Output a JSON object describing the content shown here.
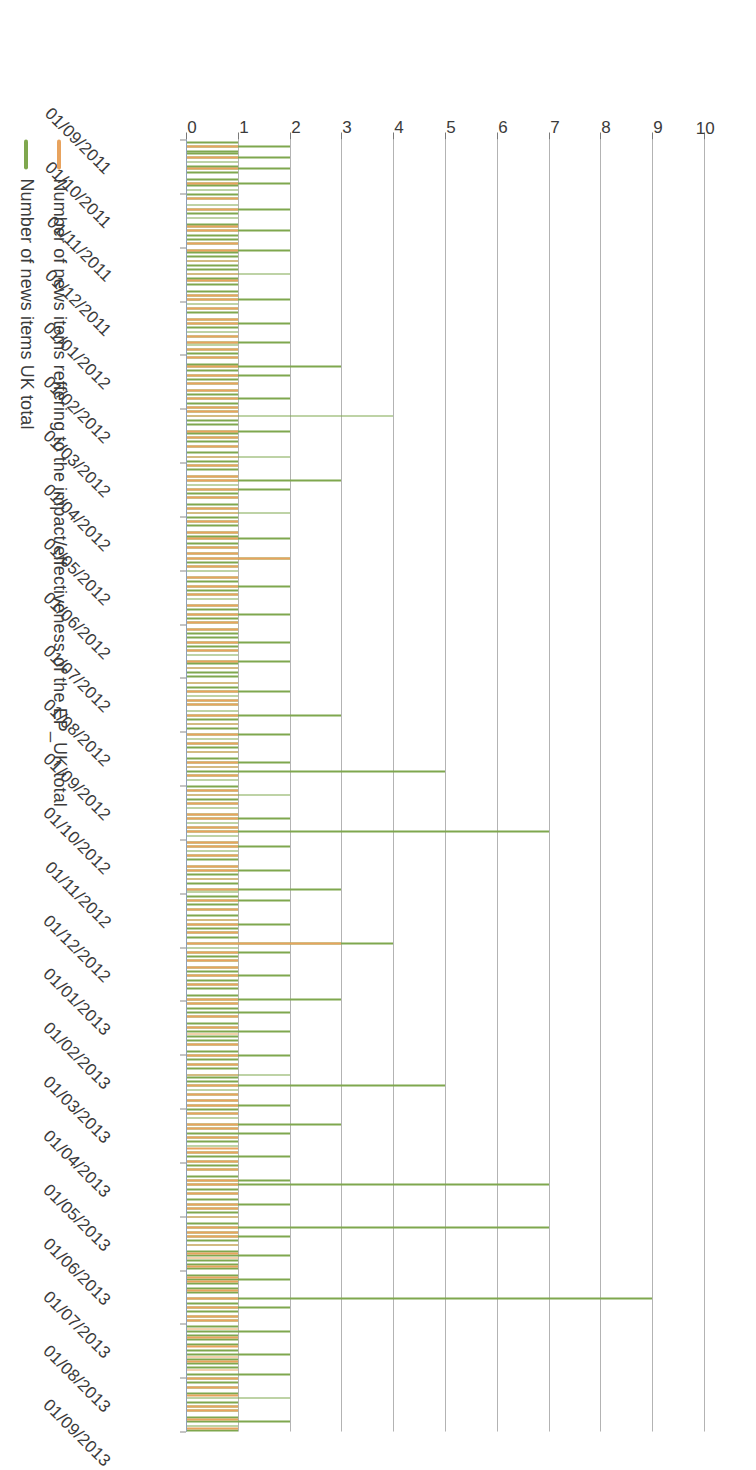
{
  "chart_data": {
    "type": "line",
    "title": "",
    "subtitle": "",
    "xlabel": "",
    "ylabel": "",
    "ylim": [
      0,
      10
    ],
    "yticks": [
      0,
      1,
      2,
      3,
      4,
      5,
      6,
      7,
      8,
      9,
      10
    ],
    "grid": true,
    "legend_position": "bottom-left",
    "orientation": "rotated-90-clockwise",
    "x_tick_labels": [
      "01/09/2011",
      "01/10/2011",
      "01/11/2011",
      "01/12/2011",
      "01/01/2012",
      "01/02/2012",
      "01/03/2012",
      "01/04/2012",
      "01/05/2012",
      "01/06/2012",
      "01/07/2012",
      "01/08/2012",
      "01/09/2012",
      "01/10/2012",
      "01/11/2012",
      "01/12/2012",
      "01/01/2013",
      "01/02/2013",
      "01/03/2013",
      "01/04/2013",
      "01/05/2013",
      "01/06/2013",
      "01/07/2013",
      "01/08/2013",
      "01/09/2013"
    ],
    "colors": {
      "series_uk_total": "#7fa74e",
      "series_ep_impact": "#e8a35e",
      "gridline": "#9a9a9a",
      "axis": "#8d9fb8",
      "text": "#3b3b3b",
      "background": "#ffffff"
    },
    "series": [
      {
        "name": "Number of news items UK total",
        "color": "#7fa74e",
        "values": [
          0,
          1,
          0,
          2,
          0,
          1,
          1,
          0,
          2,
          0,
          1,
          0,
          1,
          2,
          0,
          1,
          0,
          0,
          1,
          0,
          2,
          1,
          0,
          1,
          0,
          1,
          0,
          1,
          0,
          0,
          1,
          0,
          2,
          0,
          1,
          0,
          1,
          0,
          0,
          1,
          1,
          0,
          2,
          0,
          1,
          0,
          1,
          0,
          1,
          0,
          0,
          2,
          1,
          0,
          1,
          0,
          1,
          0,
          1,
          0,
          1,
          0,
          2,
          0,
          1,
          1,
          0,
          1,
          0,
          0,
          1,
          0,
          1,
          0,
          2,
          0,
          1,
          0,
          1,
          0,
          1,
          0,
          0,
          1,
          0,
          2,
          0,
          1,
          0,
          1,
          0,
          1,
          0,
          0,
          2,
          1,
          0,
          1,
          0,
          1,
          0,
          1,
          0,
          0,
          1,
          3,
          0,
          1,
          0,
          2,
          0,
          1,
          0,
          1,
          0,
          0,
          1,
          0,
          1,
          0,
          2,
          0,
          1,
          0,
          1,
          0,
          1,
          0,
          4,
          0,
          1,
          0,
          1,
          0,
          0,
          2,
          1,
          0,
          1,
          0,
          1,
          0,
          1,
          0,
          0,
          1,
          0,
          2,
          0,
          1,
          0,
          1,
          0,
          1,
          0,
          0,
          1,
          0,
          3,
          0,
          1,
          0,
          2,
          0,
          1,
          0,
          1,
          0,
          0,
          1,
          0,
          1,
          0,
          2,
          0,
          1,
          0,
          1,
          0,
          1,
          0,
          0,
          1,
          0,
          1,
          2,
          0,
          1,
          0,
          1,
          0,
          0,
          1,
          0,
          2,
          0,
          1,
          0,
          1,
          0,
          1,
          0,
          0,
          1,
          0,
          1,
          0,
          2,
          0,
          1,
          0,
          1,
          0,
          1,
          0,
          0,
          1,
          0,
          1,
          0,
          2,
          0,
          1,
          0,
          1,
          0,
          0,
          1,
          0,
          1,
          0,
          1,
          0,
          2,
          0,
          1,
          0,
          1,
          0,
          1,
          0,
          0,
          2,
          1,
          0,
          1,
          0,
          1,
          0,
          1,
          0,
          0,
          1,
          0,
          1,
          0,
          2,
          0,
          1,
          0,
          1,
          0,
          1,
          0,
          0,
          1,
          0,
          3,
          0,
          1,
          0,
          1,
          0,
          1,
          0,
          0,
          2,
          0,
          1,
          0,
          1,
          0,
          1,
          0,
          1,
          0,
          0,
          1,
          0,
          2,
          0,
          1,
          0,
          5,
          0,
          1,
          0,
          1,
          0,
          0,
          1,
          0,
          1,
          0,
          2,
          0,
          1,
          0,
          1,
          0,
          1,
          0,
          0,
          1,
          0,
          2,
          0,
          1,
          0,
          1,
          0,
          7,
          0,
          1,
          0,
          0,
          1,
          0,
          2,
          0,
          1,
          0,
          1,
          0,
          1,
          0,
          0,
          1,
          0,
          2,
          0,
          1,
          0,
          1,
          0,
          1,
          0,
          0,
          3,
          1,
          0,
          1,
          0,
          2,
          0,
          1,
          0,
          1,
          0,
          0,
          1,
          0,
          1,
          0,
          2,
          0,
          1,
          0,
          1,
          0,
          1,
          0,
          0,
          4,
          0,
          1,
          0,
          2,
          0,
          1,
          0,
          1,
          0,
          0,
          1,
          0,
          1,
          0,
          2,
          0,
          1,
          0,
          1,
          0,
          1,
          0,
          0,
          1,
          0,
          3,
          0,
          1,
          0,
          1,
          0,
          2,
          0,
          1,
          0,
          0,
          1,
          0,
          1,
          0,
          2,
          0,
          1,
          0,
          1,
          0,
          1,
          0,
          0,
          1,
          0,
          2,
          0,
          1,
          0,
          1,
          0,
          1,
          0,
          0,
          2,
          1,
          0,
          1,
          0,
          5,
          0,
          1,
          0,
          1,
          0,
          0,
          1,
          0,
          2,
          0,
          1,
          0,
          1,
          0,
          1,
          0,
          0,
          3,
          0,
          1,
          0,
          2,
          0,
          1,
          0,
          1,
          0,
          1,
          0,
          0,
          1,
          0,
          2,
          0,
          1,
          0,
          1,
          0,
          1,
          0,
          0,
          1,
          0,
          2,
          0,
          7,
          0,
          1,
          0,
          1,
          0,
          0,
          1,
          0,
          2,
          0,
          1,
          0,
          1,
          0,
          1,
          0,
          0,
          1,
          0,
          7,
          0,
          1,
          0,
          2,
          0,
          1,
          0,
          1,
          0,
          0,
          1,
          0,
          2,
          0,
          1,
          0,
          1,
          0,
          1,
          0,
          0,
          1,
          0,
          2,
          0,
          1,
          0,
          1,
          0,
          1,
          0,
          0,
          9,
          0,
          1,
          0,
          2,
          0,
          1,
          0,
          1,
          0,
          1,
          0,
          0,
          1,
          0,
          2,
          0,
          1,
          0,
          1,
          0,
          1,
          0,
          0,
          1,
          0,
          2,
          0,
          1,
          0,
          1,
          0,
          1,
          0,
          0,
          2,
          0,
          1,
          0,
          1,
          0,
          1,
          0,
          0,
          1,
          0,
          2,
          0,
          1,
          0,
          1,
          0,
          1,
          0,
          0,
          1,
          0,
          2,
          0,
          1,
          0,
          1
        ]
      },
      {
        "name": "Number of news items reffering to the impact/effectiveness of the EP_UK total",
        "color": "#e8a35e",
        "values": [
          0,
          0,
          0,
          1,
          0,
          0,
          0,
          0,
          1,
          0,
          0,
          0,
          0,
          1,
          0,
          0,
          0,
          0,
          0,
          0,
          1,
          0,
          0,
          0,
          0,
          0,
          0,
          1,
          0,
          0,
          0,
          0,
          1,
          0,
          0,
          0,
          0,
          0,
          0,
          0,
          1,
          0,
          1,
          0,
          0,
          0,
          0,
          0,
          1,
          0,
          0,
          1,
          0,
          0,
          0,
          0,
          1,
          0,
          0,
          0,
          0,
          0,
          1,
          0,
          0,
          1,
          0,
          0,
          0,
          0,
          0,
          0,
          1,
          0,
          1,
          0,
          0,
          0,
          1,
          0,
          0,
          0,
          0,
          1,
          0,
          1,
          0,
          0,
          0,
          0,
          0,
          1,
          0,
          0,
          1,
          0,
          0,
          1,
          0,
          0,
          0,
          1,
          0,
          0,
          0,
          1,
          0,
          0,
          0,
          1,
          0,
          0,
          0,
          1,
          0,
          0,
          1,
          0,
          0,
          0,
          1,
          0,
          0,
          0,
          1,
          0,
          1,
          0,
          1,
          0,
          0,
          0,
          0,
          0,
          0,
          1,
          0,
          0,
          1,
          0,
          0,
          0,
          1,
          0,
          0,
          0,
          0,
          1,
          0,
          0,
          0,
          1,
          0,
          0,
          0,
          0,
          1,
          0,
          1,
          0,
          0,
          0,
          1,
          0,
          0,
          0,
          1,
          0,
          0,
          0,
          0,
          1,
          0,
          1,
          0,
          0,
          0,
          1,
          0,
          0,
          0,
          0,
          1,
          0,
          0,
          1,
          0,
          0,
          0,
          1,
          0,
          0,
          1,
          0,
          2,
          0,
          0,
          0,
          1,
          0,
          0,
          0,
          0,
          1,
          0,
          0,
          0,
          1,
          0,
          0,
          0,
          1,
          0,
          0,
          0,
          0,
          1,
          0,
          0,
          0,
          1,
          0,
          0,
          0,
          1,
          0,
          0,
          1,
          0,
          0,
          0,
          0,
          0,
          1,
          0,
          0,
          0,
          1,
          0,
          0,
          0,
          0,
          1,
          0,
          0,
          1,
          0,
          0,
          0,
          0,
          0,
          0,
          1,
          0,
          0,
          0,
          1,
          0,
          0,
          0,
          1,
          0,
          1,
          0,
          0,
          0,
          0,
          1,
          0,
          0,
          0,
          1,
          0,
          0,
          0,
          0,
          1,
          0,
          0,
          0,
          1,
          0,
          0,
          0,
          1,
          0,
          0,
          0,
          0,
          1,
          0,
          1,
          0,
          0,
          0,
          1,
          0,
          0,
          0,
          0,
          0,
          0,
          1,
          0,
          1,
          0,
          0,
          0,
          1,
          0,
          0,
          0,
          0,
          1,
          0,
          1,
          0,
          0,
          0,
          1,
          0,
          1,
          0,
          0,
          0,
          0,
          1,
          0,
          1,
          0,
          0,
          0,
          1,
          0,
          0,
          0,
          0,
          1,
          0,
          1,
          0,
          0,
          0,
          1,
          0,
          0,
          0,
          0,
          1,
          0,
          0,
          0,
          0,
          1,
          0,
          0,
          0,
          1,
          0,
          0,
          0,
          0,
          1,
          0,
          1,
          0,
          0,
          0,
          1,
          0,
          0,
          0,
          0,
          3,
          0,
          0,
          0,
          1,
          0,
          0,
          0,
          1,
          0,
          0,
          1,
          0,
          0,
          0,
          1,
          0,
          0,
          0,
          1,
          0,
          0,
          0,
          0,
          0,
          0,
          1,
          0,
          1,
          0,
          0,
          0,
          0,
          0,
          1,
          0,
          0,
          0,
          0,
          1,
          0,
          0,
          1,
          0,
          0,
          0,
          0,
          1,
          0,
          0,
          0,
          0,
          1,
          0,
          0,
          0,
          1,
          0,
          0,
          0,
          0,
          1,
          0,
          0,
          0,
          0,
          1,
          0,
          0,
          0,
          1,
          0,
          0,
          1,
          0,
          1,
          0,
          0,
          0,
          1,
          0,
          0,
          0,
          0,
          1,
          0,
          1,
          0,
          0,
          0,
          1,
          0,
          0,
          0,
          0,
          1,
          0,
          1,
          0,
          0,
          0,
          1,
          0,
          0,
          0,
          1,
          0,
          0,
          0,
          0,
          1,
          0,
          1,
          0,
          0,
          0,
          1,
          0,
          0,
          0,
          0,
          1,
          0,
          1,
          0,
          0,
          0,
          1,
          0,
          0,
          0,
          0,
          1,
          0,
          1,
          0,
          1,
          0,
          0,
          0,
          1,
          0,
          0,
          0,
          1,
          0,
          1,
          0,
          0,
          0,
          1,
          0,
          0,
          0,
          0,
          1,
          0,
          1,
          0,
          0,
          0,
          1,
          0,
          0,
          0,
          1,
          0,
          0,
          0,
          1,
          0,
          0,
          0,
          1,
          0,
          1,
          0,
          0,
          0,
          1,
          0,
          0,
          0,
          1,
          0,
          0,
          0,
          1,
          0,
          0,
          0,
          0,
          1,
          0,
          1,
          0,
          0,
          0,
          1,
          0,
          0,
          0,
          1,
          0,
          0,
          0,
          1,
          0,
          0,
          0,
          1,
          0,
          0,
          0,
          0,
          1,
          0,
          1,
          0,
          0,
          0,
          1,
          0,
          0,
          0,
          1,
          0
        ]
      }
    ],
    "notes": {
      "x_range": "01/09/2011 to 01/09/2013",
      "x_tick_interval": "monthly",
      "peak_value": 9,
      "peak_series": "Number of news items UK total"
    }
  },
  "legend": {
    "entries": [
      {
        "label": "Number of news items reffering to the impact/effectiveness of the EP_UK total",
        "color": "#e8a35e"
      },
      {
        "label": "Number of news items UK total",
        "color": "#7fa74e"
      }
    ]
  },
  "axis": {
    "value_ticks": [
      "0",
      "1",
      "2",
      "3",
      "4",
      "5",
      "6",
      "7",
      "8",
      "9",
      "10"
    ]
  }
}
